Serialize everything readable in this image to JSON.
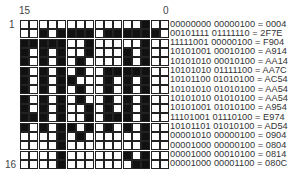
{
  "labels": {
    "top_left_bit": "15",
    "top_right_bit": "0",
    "first_row": "1",
    "last_row": "16"
  },
  "rows": [
    {
      "bin": "00000000 00000100",
      "hex": "0004"
    },
    {
      "bin": "00101111 01111110",
      "hex": "2F7E"
    },
    {
      "bin": "11111001 00000100",
      "hex": "F904"
    },
    {
      "bin": "10101001 00010100",
      "hex": "A914"
    },
    {
      "bin": "10101010 00010100",
      "hex": "AA14"
    },
    {
      "bin": "10101010 01111100",
      "hex": "AA7C"
    },
    {
      "bin": "10101100 01010100",
      "hex": "AC54"
    },
    {
      "bin": "10101010 01010100",
      "hex": "AA54"
    },
    {
      "bin": "10101010 01010100",
      "hex": "AA54"
    },
    {
      "bin": "10101001 01010100",
      "hex": "A954"
    },
    {
      "bin": "11101001 01110100",
      "hex": "E974"
    },
    {
      "bin": "10101101 01010100",
      "hex": "AD54"
    },
    {
      "bin": "00001010 00000100",
      "hex": "0904"
    },
    {
      "bin": "00001000 00000100",
      "hex": "0804"
    },
    {
      "bin": "00001000 00010100",
      "hex": "0814"
    },
    {
      "bin": "00001000 00001100",
      "hex": "080C"
    }
  ],
  "colors": {
    "on": "#111111",
    "off": "#ffffff",
    "border": "#222222"
  }
}
